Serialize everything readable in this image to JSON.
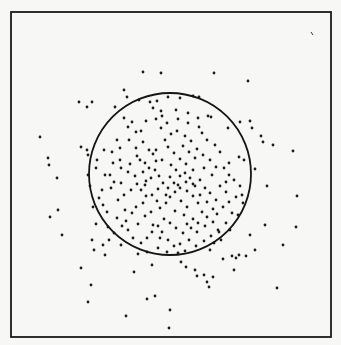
{
  "chart_data": {
    "type": "scatter",
    "title": "",
    "xlabel": "",
    "ylabel": "",
    "grid": false,
    "legend": null,
    "frame": {
      "x0": 11,
      "y0": 12,
      "x1": 331,
      "y1": 337
    },
    "annotations": [
      {
        "type": "circle",
        "cx": 170,
        "cy": 174,
        "r": 81,
        "note": "circle boundary enclosing the dense cluster"
      }
    ],
    "points": [
      [
        143,
        72
      ],
      [
        161,
        73
      ],
      [
        214,
        73
      ],
      [
        248,
        81
      ],
      [
        79,
        102
      ],
      [
        124,
        90
      ],
      [
        127,
        97
      ],
      [
        92,
        102
      ],
      [
        150,
        102
      ],
      [
        168,
        97
      ],
      [
        193,
        96
      ],
      [
        87,
        107
      ],
      [
        115,
        107
      ],
      [
        139,
        100
      ],
      [
        157,
        101
      ],
      [
        180,
        98
      ],
      [
        199,
        97
      ],
      [
        124,
        118
      ],
      [
        81,
        147
      ],
      [
        87,
        150
      ],
      [
        88,
        155
      ],
      [
        40,
        137
      ],
      [
        48,
        158
      ],
      [
        49,
        165
      ],
      [
        57,
        178
      ],
      [
        58,
        210
      ],
      [
        50,
        217
      ],
      [
        62,
        235
      ],
      [
        92,
        240
      ],
      [
        81,
        268
      ],
      [
        94,
        250
      ],
      [
        103,
        245
      ],
      [
        105,
        255
      ],
      [
        91,
        285
      ],
      [
        88,
        302
      ],
      [
        126,
        316
      ],
      [
        147,
        299
      ],
      [
        155,
        296
      ],
      [
        170,
        310
      ],
      [
        169,
        328
      ],
      [
        152,
        265
      ],
      [
        134,
        272
      ],
      [
        138,
        254
      ],
      [
        181,
        262
      ],
      [
        186,
        267
      ],
      [
        195,
        270
      ],
      [
        197,
        276
      ],
      [
        204,
        275
      ],
      [
        207,
        282
      ],
      [
        213,
        277
      ],
      [
        209,
        287
      ],
      [
        185,
        251
      ],
      [
        223,
        259
      ],
      [
        232,
        256
      ],
      [
        236,
        258
      ],
      [
        234,
        270
      ],
      [
        239,
        255
      ],
      [
        246,
        256
      ],
      [
        250,
        235
      ],
      [
        265,
        225
      ],
      [
        283,
        245
      ],
      [
        277,
        288
      ],
      [
        296,
        227
      ],
      [
        252,
        128
      ],
      [
        261,
        136
      ],
      [
        263,
        142
      ],
      [
        273,
        145
      ],
      [
        293,
        151
      ],
      [
        255,
        169
      ],
      [
        267,
        186
      ],
      [
        297,
        196
      ],
      [
        242,
        195
      ],
      [
        255,
        250
      ],
      [
        93,
        207
      ],
      [
        103,
        205
      ],
      [
        96,
        224
      ],
      [
        108,
        227
      ],
      [
        90,
        186
      ],
      [
        88,
        175
      ],
      [
        96,
        168
      ],
      [
        105,
        175
      ],
      [
        111,
        188
      ],
      [
        120,
        160
      ],
      [
        97,
        160
      ],
      [
        104,
        150
      ],
      [
        117,
        140
      ],
      [
        128,
        127
      ],
      [
        132,
        122
      ],
      [
        141,
        131
      ],
      [
        156,
        119
      ],
      [
        153,
        108
      ],
      [
        161,
        111
      ],
      [
        178,
        119
      ],
      [
        188,
        123
      ],
      [
        198,
        118
      ],
      [
        211,
        117
      ],
      [
        228,
        128
      ],
      [
        240,
        122
      ],
      [
        250,
        121
      ],
      [
        244,
        160
      ],
      [
        239,
        157
      ],
      [
        229,
        163
      ],
      [
        208,
        116
      ],
      [
        136,
        148
      ],
      [
        140,
        160
      ],
      [
        145,
        163
      ],
      [
        149,
        150
      ],
      [
        153,
        154
      ],
      [
        156,
        161
      ],
      [
        159,
        176
      ],
      [
        151,
        178
      ],
      [
        145,
        185
      ],
      [
        137,
        184
      ],
      [
        131,
        190
      ],
      [
        124,
        195
      ],
      [
        118,
        200
      ],
      [
        125,
        210
      ],
      [
        132,
        213
      ],
      [
        136,
        207
      ],
      [
        143,
        203
      ],
      [
        146,
        196
      ],
      [
        152,
        195
      ],
      [
        157,
        201
      ],
      [
        160,
        208
      ],
      [
        166,
        203
      ],
      [
        170,
        197
      ],
      [
        175,
        192
      ],
      [
        178,
        185
      ],
      [
        186,
        182
      ],
      [
        190,
        178
      ],
      [
        195,
        186
      ],
      [
        200,
        180
      ],
      [
        205,
        188
      ],
      [
        210,
        193
      ],
      [
        216,
        200
      ],
      [
        220,
        186
      ],
      [
        226,
        182
      ],
      [
        229,
        175
      ],
      [
        224,
        168
      ],
      [
        216,
        167
      ],
      [
        210,
        160
      ],
      [
        203,
        155
      ],
      [
        197,
        149
      ],
      [
        191,
        141
      ],
      [
        185,
        136
      ],
      [
        177,
        131
      ],
      [
        171,
        134
      ],
      [
        165,
        140
      ],
      [
        168,
        147
      ],
      [
        174,
        153
      ],
      [
        180,
        159
      ],
      [
        186,
        164
      ],
      [
        176,
        170
      ],
      [
        170,
        177
      ],
      [
        163,
        183
      ],
      [
        158,
        189
      ],
      [
        181,
        201
      ],
      [
        187,
        207
      ],
      [
        193,
        196
      ],
      [
        198,
        203
      ],
      [
        202,
        212
      ],
      [
        207,
        217
      ],
      [
        213,
        222
      ],
      [
        217,
        214
      ],
      [
        223,
        207
      ],
      [
        229,
        202
      ],
      [
        236,
        197
      ],
      [
        232,
        213
      ],
      [
        226,
        223
      ],
      [
        218,
        230
      ],
      [
        211,
        236
      ],
      [
        204,
        241
      ],
      [
        196,
        246
      ],
      [
        189,
        240
      ],
      [
        183,
        233
      ],
      [
        176,
        228
      ],
      [
        170,
        223
      ],
      [
        164,
        219
      ],
      [
        158,
        226
      ],
      [
        152,
        232
      ],
      [
        147,
        238
      ],
      [
        141,
        243
      ],
      [
        133,
        238
      ],
      [
        128,
        230
      ],
      [
        122,
        226
      ],
      [
        117,
        218
      ],
      [
        126,
        221
      ],
      [
        138,
        224
      ],
      [
        145,
        216
      ],
      [
        151,
        212
      ],
      [
        162,
        232
      ],
      [
        168,
        240
      ],
      [
        174,
        246
      ],
      [
        180,
        244
      ],
      [
        191,
        228
      ],
      [
        198,
        223
      ],
      [
        205,
        226
      ],
      [
        214,
        243
      ],
      [
        221,
        240
      ],
      [
        193,
        219
      ],
      [
        184,
        215
      ],
      [
        175,
        211
      ],
      [
        166,
        195
      ],
      [
        155,
        170
      ],
      [
        149,
        168
      ],
      [
        143,
        172
      ],
      [
        135,
        176
      ],
      [
        128,
        172
      ],
      [
        121,
        168
      ],
      [
        113,
        163
      ],
      [
        110,
        175
      ],
      [
        114,
        182
      ],
      [
        121,
        183
      ],
      [
        130,
        164
      ],
      [
        137,
        156
      ],
      [
        161,
        128
      ],
      [
        167,
        123
      ],
      [
        183,
        146
      ],
      [
        189,
        152
      ],
      [
        195,
        158
      ],
      [
        215,
        145
      ],
      [
        220,
        152
      ],
      [
        212,
        175
      ],
      [
        204,
        168
      ],
      [
        193,
        170
      ],
      [
        187,
        191
      ],
      [
        180,
        188
      ],
      [
        174,
        183
      ],
      [
        168,
        188
      ],
      [
        162,
        160
      ],
      [
        156,
        150
      ],
      [
        143,
        142
      ],
      [
        129,
        140
      ],
      [
        120,
        148
      ],
      [
        112,
        152
      ],
      [
        102,
        190
      ],
      [
        99,
        198
      ],
      [
        107,
        212
      ],
      [
        114,
        233
      ],
      [
        109,
        240
      ],
      [
        121,
        245
      ],
      [
        147,
        252
      ],
      [
        158,
        248
      ],
      [
        167,
        252
      ],
      [
        178,
        253
      ],
      [
        210,
        250
      ],
      [
        219,
        232
      ],
      [
        234,
        180
      ],
      [
        240,
        186
      ],
      [
        243,
        203
      ],
      [
        238,
        215
      ],
      [
        230,
        230
      ],
      [
        202,
        133
      ],
      [
        207,
        140
      ],
      [
        199,
        127
      ],
      [
        188,
        113
      ],
      [
        176,
        110
      ],
      [
        162,
        116
      ],
      [
        146,
        121
      ],
      [
        136,
        132
      ],
      [
        171,
        165
      ],
      [
        180,
        176
      ],
      [
        185,
        173
      ],
      [
        193,
        184
      ],
      [
        200,
        195
      ],
      [
        207,
        202
      ],
      [
        146,
        181
      ],
      [
        141,
        190
      ],
      [
        153,
        225
      ],
      [
        160,
        238
      ],
      [
        187,
        224
      ],
      [
        197,
        232
      ],
      [
        226,
        192
      ],
      [
        213,
        209
      ]
    ]
  }
}
